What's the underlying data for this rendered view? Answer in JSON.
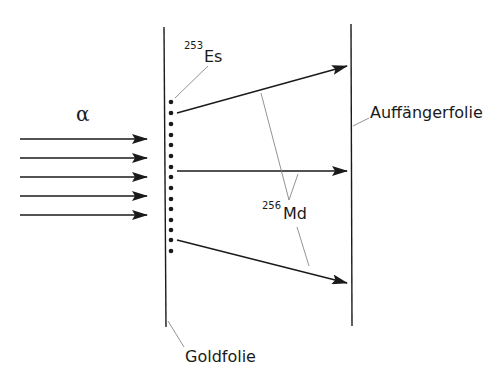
{
  "diagram": {
    "type": "physics-experiment-schematic",
    "colors": {
      "ink": "#1a1a1a",
      "leader": "#777777",
      "background": "#ffffff"
    },
    "incoming_beam": {
      "label": "α",
      "arrow_count": 5
    },
    "gold_foil": {
      "label": "Goldfolie"
    },
    "target_nucleus": {
      "mass_number": "253",
      "symbol": "Es",
      "dot_count": 15
    },
    "product_nucleus": {
      "mass_number": "256",
      "symbol": "Md",
      "recoil_arrow_count": 3
    },
    "catcher_foil": {
      "label": "Auffängerfolie"
    }
  }
}
